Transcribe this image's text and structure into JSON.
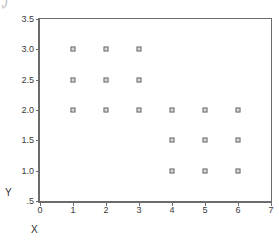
{
  "figure": {
    "width": 279,
    "height": 241,
    "background": "#ffffff",
    "frame_color": "#6b6b6b",
    "corner_artifact": ",)"
  },
  "chart_data": {
    "type": "scatter",
    "title": "",
    "subtitle": "",
    "xlabel": "X",
    "ylabel": "Y",
    "xlim": [
      0,
      7
    ],
    "ylim": [
      0.5,
      3.5
    ],
    "grid": false,
    "legend": null,
    "legend_position": "none",
    "marker": {
      "shape": "open-square",
      "size_px": 5,
      "edge_color": "#555555",
      "face_color": "#ffffff"
    },
    "xticks": [
      0,
      1,
      2,
      3,
      4,
      5,
      6,
      7
    ],
    "xtick_labels": [
      "0",
      "1",
      "2",
      "3",
      "4",
      "5",
      "6",
      "7"
    ],
    "yticks": [
      0.5,
      1.0,
      1.5,
      2.0,
      2.5,
      3.0,
      3.5
    ],
    "ytick_labels": [
      ".5",
      "1.0",
      "1.5",
      "2.0",
      "2.5",
      "3.0",
      "3.5"
    ],
    "x": [
      1,
      2,
      3,
      1,
      2,
      3,
      1,
      2,
      3,
      4,
      5,
      6,
      4,
      5,
      6,
      4,
      5,
      6
    ],
    "y": [
      3.0,
      3.0,
      3.0,
      2.5,
      2.5,
      2.5,
      2.0,
      2.0,
      2.0,
      2.0,
      2.0,
      2.0,
      1.5,
      1.5,
      1.5,
      1.0,
      1.0,
      1.0
    ],
    "points": [
      {
        "x": 1,
        "y": 3.0
      },
      {
        "x": 2,
        "y": 3.0
      },
      {
        "x": 3,
        "y": 3.0
      },
      {
        "x": 1,
        "y": 2.5
      },
      {
        "x": 2,
        "y": 2.5
      },
      {
        "x": 3,
        "y": 2.5
      },
      {
        "x": 1,
        "y": 2.0
      },
      {
        "x": 2,
        "y": 2.0
      },
      {
        "x": 3,
        "y": 2.0
      },
      {
        "x": 4,
        "y": 2.0
      },
      {
        "x": 5,
        "y": 2.0
      },
      {
        "x": 6,
        "y": 2.0
      },
      {
        "x": 4,
        "y": 1.5
      },
      {
        "x": 5,
        "y": 1.5
      },
      {
        "x": 6,
        "y": 1.5
      },
      {
        "x": 4,
        "y": 1.0
      },
      {
        "x": 5,
        "y": 1.0
      },
      {
        "x": 6,
        "y": 1.0
      }
    ]
  }
}
